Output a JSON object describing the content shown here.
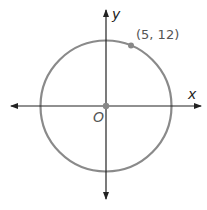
{
  "diagram": {
    "axis_x_label": "x",
    "axis_y_label": "y",
    "origin_label": "O",
    "point_label": "(5, 12)",
    "point": [
      5,
      12
    ],
    "radius": 13,
    "colors": {
      "circle": "#888888",
      "axes": "#222222",
      "point": "#888888"
    }
  }
}
